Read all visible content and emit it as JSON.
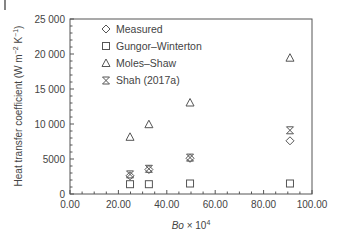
{
  "chart_data": {
    "type": "scatter",
    "title": "",
    "xlabel": "Bo × 10^4",
    "xlabel_main": "Bo",
    "xlabel_suffix": " × 10",
    "xlabel_exp": "4",
    "ylabel": "Heat transfer coefficient (W m^-2 K^-1)",
    "ylabel_main": "Heat transfer coefficient (W m",
    "ylabel_exp1": "−2",
    "ylabel_mid": " K",
    "ylabel_exp2": "−1",
    "ylabel_end": ")",
    "xlim": [
      0,
      100
    ],
    "ylim": [
      0,
      25000
    ],
    "xticks": [
      "0.00",
      "20.00",
      "40.00",
      "60.00",
      "80.00",
      "100.00"
    ],
    "xtick_values": [
      0,
      20,
      40,
      60,
      80,
      100
    ],
    "yticks": [
      "0",
      "5000",
      "10 000",
      "15 000",
      "20 000",
      "25 000"
    ],
    "ytick_values": [
      0,
      5000,
      10000,
      15000,
      20000,
      25000
    ],
    "grid": false,
    "legend_position": "upper left",
    "series": [
      {
        "name": "Measured",
        "marker": "diamond",
        "x": [
          24.8,
          32.6,
          49.6,
          90.9
        ],
        "y": [
          2600,
          3500,
          5100,
          7600
        ]
      },
      {
        "name": "Gungor–Winterton",
        "marker": "square",
        "x": [
          24.8,
          32.6,
          49.6,
          90.9
        ],
        "y": [
          1400,
          1400,
          1500,
          1500
        ]
      },
      {
        "name": "Moles–Shaw",
        "marker": "triangle",
        "x": [
          24.8,
          32.6,
          49.6,
          90.9
        ],
        "y": [
          8100,
          9900,
          13000,
          19400
        ]
      },
      {
        "name": "Shah (2017a)",
        "marker": "asterisk",
        "x": [
          24.8,
          32.6,
          49.6,
          90.9
        ],
        "y": [
          2800,
          3600,
          5200,
          9100
        ]
      }
    ]
  }
}
